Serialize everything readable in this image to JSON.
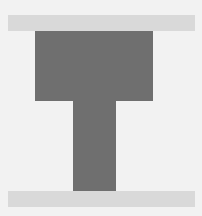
{
  "figure": {
    "colors": {
      "background": "#f2f2f2",
      "band": "#d9d9d9",
      "shape": "#6f6f6f"
    },
    "elements": [
      {
        "name": "top-band",
        "x": 8,
        "y": 15,
        "width": 187,
        "height": 16
      },
      {
        "name": "t-crossbar",
        "x": 35,
        "y": 31,
        "width": 118,
        "height": 70
      },
      {
        "name": "t-stem",
        "x": 73,
        "y": 100,
        "width": 43,
        "height": 91
      },
      {
        "name": "bottom-band",
        "x": 8,
        "y": 191,
        "width": 187,
        "height": 16
      }
    ]
  }
}
